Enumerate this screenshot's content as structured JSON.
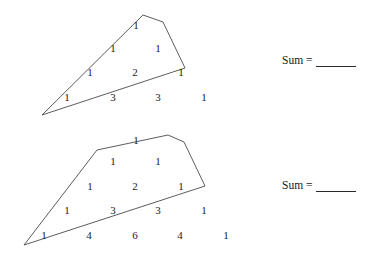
{
  "page": {
    "background_color": "#ffffff",
    "ink_color": "#1a1a1a",
    "width": 380,
    "height": 258
  },
  "figures": [
    {
      "id": "figure-1",
      "name": "pascal-triangle-shape-1",
      "outline_shape": "triangle-with-truncated-apex",
      "outline_points": "42,115 143,15 163,22 185,68",
      "rows": [
        {
          "row_index": 0,
          "y": 25,
          "cells": [
            {
              "value": "1",
              "x": 136,
              "inside": true
            }
          ]
        },
        {
          "row_index": 1,
          "y": 48,
          "cells": [
            {
              "value": "1",
              "x": 113,
              "inside": true
            },
            {
              "value": "1",
              "x": 158,
              "inside": true
            }
          ]
        },
        {
          "row_index": 2,
          "y": 72,
          "cells": [
            {
              "value": "1",
              "x": 90,
              "inside": true
            },
            {
              "value": "2",
              "x": 135,
              "inside": true
            },
            {
              "value": "1",
              "x": 181,
              "inside": true
            }
          ]
        },
        {
          "row_index": 3,
          "y": 97,
          "cells": [
            {
              "value": "1",
              "x": 67,
              "inside": true
            },
            {
              "value": "3",
              "x": 113,
              "inside": false
            },
            {
              "value": "3",
              "x": 158,
              "inside": false
            },
            {
              "value": "1",
              "x": 204,
              "inside": false
            }
          ]
        }
      ],
      "sum": {
        "label": "Sum =",
        "answer": "",
        "x": 282,
        "y": 55
      }
    },
    {
      "id": "figure-2",
      "name": "pascal-triangle-shape-2",
      "outline_shape": "trapezoid-with-flat-top",
      "outline_points": "24,245 97,150 168,135 184,142 205,186",
      "rows": [
        {
          "row_index": 0,
          "y": 140,
          "cells": [
            {
              "value": "1",
              "x": 136,
              "inside": true
            }
          ]
        },
        {
          "row_index": 1,
          "y": 161,
          "cells": [
            {
              "value": "1",
              "x": 113,
              "inside": true
            },
            {
              "value": "1",
              "x": 158,
              "inside": true
            }
          ]
        },
        {
          "row_index": 2,
          "y": 186,
          "cells": [
            {
              "value": "1",
              "x": 90,
              "inside": true
            },
            {
              "value": "2",
              "x": 135,
              "inside": true
            },
            {
              "value": "1",
              "x": 181,
              "inside": true
            }
          ]
        },
        {
          "row_index": 3,
          "y": 210,
          "cells": [
            {
              "value": "1",
              "x": 67,
              "inside": true
            },
            {
              "value": "3",
              "x": 113,
              "inside": true
            },
            {
              "value": "3",
              "x": 158,
              "inside": true
            },
            {
              "value": "1",
              "x": 204,
              "inside": false
            }
          ]
        },
        {
          "row_index": 4,
          "y": 235,
          "cells": [
            {
              "value": "1",
              "x": 44,
              "inside": true
            },
            {
              "value": "4",
              "x": 89,
              "inside": false
            },
            {
              "value": "6",
              "x": 135,
              "inside": false
            },
            {
              "value": "4",
              "x": 180,
              "inside": false
            },
            {
              "value": "1",
              "x": 226,
              "inside": false
            }
          ]
        }
      ],
      "sum": {
        "label": "Sum =",
        "answer": "",
        "x": 282,
        "y": 180
      }
    }
  ]
}
